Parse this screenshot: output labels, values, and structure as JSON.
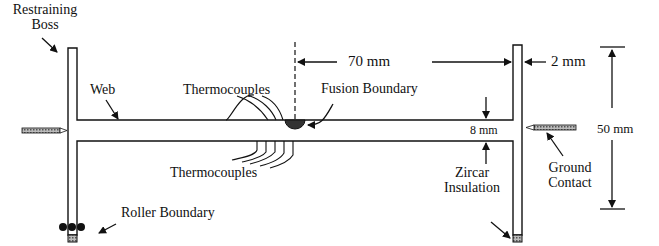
{
  "labels": {
    "restraining_boss": [
      "Restraining",
      "Boss"
    ],
    "web": "Web",
    "thermocouples_top": "Thermocouples",
    "fusion_boundary": "Fusion Boundary",
    "thermocouples_bottom": "Thermocouples",
    "roller_boundary": "Roller Boundary",
    "zircar_insulation": [
      "Zircar",
      "Insulation"
    ],
    "ground_contact": [
      "Ground",
      "Contact"
    ]
  },
  "dimensions": {
    "half_length": "70 mm",
    "boss_thickness": "2 mm",
    "web_thickness": "8 mm",
    "height": "50 mm"
  },
  "colors": {
    "line": "#111111",
    "hatch": "#888888"
  }
}
